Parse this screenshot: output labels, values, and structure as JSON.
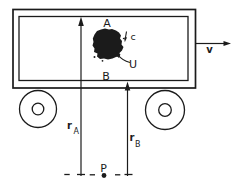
{
  "diagram": {
    "labels": {
      "point_a": "A",
      "point_b": "B",
      "mass_c": "c",
      "velocity_u": "U",
      "cart_velocity": "v",
      "point_p": "P",
      "radius_a": {
        "base": "r",
        "sub": "A"
      },
      "radius_b": {
        "base": "r",
        "sub": "B"
      }
    },
    "colors": {
      "ink": "#1b1b1b",
      "paper": "#ffffff"
    }
  }
}
